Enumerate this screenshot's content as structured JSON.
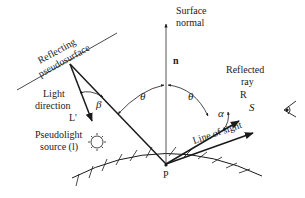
{
  "diagram": {
    "type": "specular-reflection-geometry",
    "labels": {
      "surface_normal_line1": "Surface",
      "surface_normal_line2": "normal",
      "normal_vector": "n",
      "reflecting_line1": "Reflecting",
      "reflecting_line2": "pseudosurface",
      "light_line1": "Light",
      "light_line2": "direction",
      "light_vector": "L'",
      "pseudolight_line1": "Pseudolight",
      "pseudolight_line2": "source (l)",
      "reflected_line1": "Reflected",
      "reflected_line2": "ray",
      "reflected_vector": "R",
      "sight_vector": "S",
      "line_of_sight": "Line of sight",
      "point": "P"
    },
    "angles": {
      "theta_left": "θ",
      "theta_right": "θ",
      "beta": "β",
      "alpha": "α"
    },
    "colors": {
      "stroke": "#1a1a1a",
      "normal_stroke": "#555555",
      "background": "#ffffff"
    }
  }
}
